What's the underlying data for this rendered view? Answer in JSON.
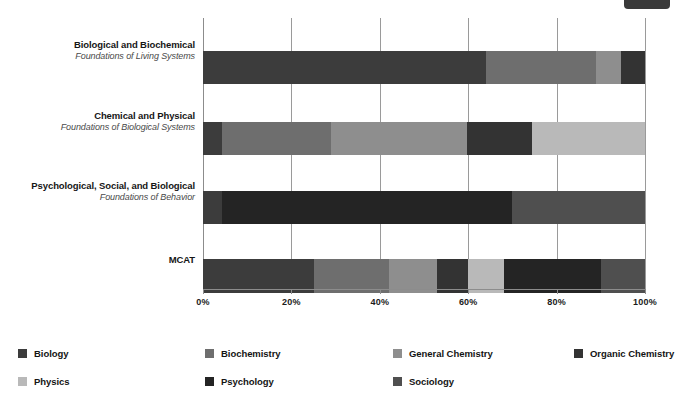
{
  "chart_data": {
    "type": "bar",
    "orientation": "horizontal",
    "stacked": true,
    "normalized": true,
    "title": "",
    "xlabel": "",
    "ylabel": "",
    "xlim": [
      0,
      100
    ],
    "grid": true,
    "legend_position": "bottom",
    "x_ticks": [
      "0%",
      "20%",
      "40%",
      "60%",
      "80%",
      "100%"
    ],
    "x_tick_values": [
      0,
      20,
      40,
      60,
      80,
      100
    ],
    "categories": [
      {
        "line1": "Biological and Biochemical",
        "line2": "Foundations of Living Systems"
      },
      {
        "line1": "Chemical and Physical",
        "line2": "Foundations of Biological Systems"
      },
      {
        "line1": "Psychological, Social, and Biological",
        "line2": "Foundations of Behavior"
      },
      {
        "line1": "MCAT",
        "line2": ""
      }
    ],
    "series": [
      {
        "name": "Biology",
        "color": "#3c3c3c",
        "values": [
          64.0,
          4.3,
          4.3,
          25.0
        ]
      },
      {
        "name": "Biochemistry",
        "color": "#6e6e6e",
        "values": [
          25.0,
          24.7,
          0.0,
          17.0
        ]
      },
      {
        "name": "General Chemistry",
        "color": "#8e8e8e",
        "values": [
          5.5,
          30.8,
          0.0,
          11.0
        ]
      },
      {
        "name": "Organic Chemistry",
        "color": "#333333",
        "values": [
          5.5,
          14.6,
          0.0,
          7.0
        ]
      },
      {
        "name": "Physics",
        "color": "#b9b9b9",
        "values": [
          0.0,
          25.6,
          0.0,
          8.0
        ]
      },
      {
        "name": "Psychology",
        "color": "#242424",
        "values": [
          0.0,
          0.0,
          65.7,
          22.0
        ]
      },
      {
        "name": "Sociology",
        "color": "#4f4f4f",
        "values": [
          0.0,
          0.0,
          30.0,
          10.0
        ]
      }
    ]
  },
  "legend": {
    "items": [
      {
        "label": "Biology",
        "color": "#3c3c3c"
      },
      {
        "label": "Biochemistry",
        "color": "#6e6e6e"
      },
      {
        "label": "General Chemistry",
        "color": "#8e8e8e"
      },
      {
        "label": "Organic Chemistry",
        "color": "#333333"
      },
      {
        "label": "Physics",
        "color": "#b9b9b9"
      },
      {
        "label": "Psychology",
        "color": "#242424"
      },
      {
        "label": "Sociology",
        "color": "#4f4f4f"
      }
    ]
  }
}
